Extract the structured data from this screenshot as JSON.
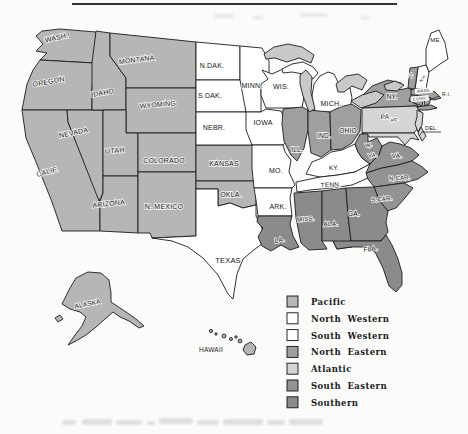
{
  "figure": {
    "type": "printed-us-regions-map",
    "paper_color": "#fbfbf9",
    "border_color": "#1c1c1c",
    "lake_color": "#c9c9c9",
    "label_color": "#161616"
  },
  "regions": [
    {
      "id": "pacific",
      "label": "Pacific",
      "color": "#b6b6b6"
    },
    {
      "id": "north_western",
      "label": "North Western",
      "color": "#ffffff"
    },
    {
      "id": "south_western",
      "label": "South Western",
      "color": "#ffffff"
    },
    {
      "id": "north_eastern",
      "label": "North Eastern",
      "color": "#9f9f9f"
    },
    {
      "id": "atlantic",
      "label": "Atlantic",
      "color": "#d5d5d5"
    },
    {
      "id": "south_eastern",
      "label": "South Eastern",
      "color": "#939393"
    },
    {
      "id": "southern",
      "label": "Southern",
      "color": "#8b8b8b"
    }
  ],
  "map": {
    "states": [
      {
        "id": "wa",
        "label": "WASH.",
        "region": "pacific"
      },
      {
        "id": "or",
        "label": "OREGON",
        "region": "pacific"
      },
      {
        "id": "ca",
        "label": "CALIF.",
        "region": "pacific"
      },
      {
        "id": "nv",
        "label": "NEVADA",
        "region": "pacific"
      },
      {
        "id": "id",
        "label": "IDAHO",
        "region": "pacific"
      },
      {
        "id": "mt",
        "label": "MONTANA",
        "region": "pacific"
      },
      {
        "id": "wy",
        "label": "WYOMING",
        "region": "pacific"
      },
      {
        "id": "ut",
        "label": "UTAH",
        "region": "pacific"
      },
      {
        "id": "co",
        "label": "COLORADO",
        "region": "pacific"
      },
      {
        "id": "az",
        "label": "ARIZONA",
        "region": "pacific"
      },
      {
        "id": "nm",
        "label": "N. MEXICO",
        "region": "pacific"
      },
      {
        "id": "ks",
        "label": "KANSAS",
        "region": "pacific"
      },
      {
        "id": "ok",
        "label": "OKLA.",
        "region": "pacific"
      },
      {
        "id": "nd",
        "label": "N.DAK.",
        "region": "north_western"
      },
      {
        "id": "sd",
        "label": "S.DAK.",
        "region": "north_western"
      },
      {
        "id": "ne",
        "label": "NEBR.",
        "region": "north_western"
      },
      {
        "id": "mn",
        "label": "MINN.",
        "region": "north_western"
      },
      {
        "id": "ia",
        "label": "IOWA",
        "region": "north_western"
      },
      {
        "id": "wi",
        "label": "WIS.",
        "region": "north_western"
      },
      {
        "id": "mi",
        "label": "MICH.",
        "region": "north_western"
      },
      {
        "id": "me",
        "label": "ME.",
        "region": "north_western"
      },
      {
        "id": "nh",
        "label": "N.H.",
        "region": "north_western"
      },
      {
        "id": "mo",
        "label": "MO.",
        "region": "south_western"
      },
      {
        "id": "tx",
        "label": "TEXAS",
        "region": "south_western"
      },
      {
        "id": "ar",
        "label": "ARK.",
        "region": "south_western"
      },
      {
        "id": "ky",
        "label": "KY.",
        "region": "south_western"
      },
      {
        "id": "tn",
        "label": "TENN.",
        "region": "south_western"
      },
      {
        "id": "il",
        "label": "ILL.",
        "region": "north_eastern"
      },
      {
        "id": "in",
        "label": "IND.",
        "region": "north_eastern"
      },
      {
        "id": "oh",
        "label": "OHIO",
        "region": "north_eastern"
      },
      {
        "id": "ny",
        "label": "NY.",
        "region": "north_eastern"
      },
      {
        "id": "vt",
        "label": "VT",
        "region": "north_eastern"
      },
      {
        "id": "ma",
        "label": "MASS.",
        "region": "north_eastern"
      },
      {
        "id": "ct",
        "label": "CONN.",
        "region": "north_eastern"
      },
      {
        "id": "ri",
        "label": "R.I.",
        "region": "north_eastern"
      },
      {
        "id": "pa",
        "label": "PA.",
        "region": "atlantic"
      },
      {
        "id": "nj",
        "label": "",
        "region": "atlantic"
      },
      {
        "id": "de",
        "label": "DEL.",
        "region": "atlantic"
      },
      {
        "id": "md",
        "label": "MD.",
        "region": "atlantic"
      },
      {
        "id": "wv",
        "label": "W.",
        "label2": "VA.",
        "region": "south_eastern"
      },
      {
        "id": "va",
        "label": "VA.",
        "region": "south_eastern"
      },
      {
        "id": "nc",
        "label": "N.CAR.",
        "region": "south_eastern"
      },
      {
        "id": "sc",
        "label": "S.CAR.",
        "region": "south_eastern"
      },
      {
        "id": "la",
        "label": "LA.",
        "region": "southern"
      },
      {
        "id": "ms",
        "label": "MISS.",
        "region": "southern"
      },
      {
        "id": "al",
        "label": "ALA.",
        "region": "southern"
      },
      {
        "id": "ga",
        "label": "GA.",
        "region": "southern"
      },
      {
        "id": "fl",
        "label": "FLA.",
        "region": "southern"
      },
      {
        "id": "ak",
        "label": "ALASKA",
        "region": "pacific"
      },
      {
        "id": "hi",
        "label": "HAWAII",
        "region": "pacific"
      }
    ]
  }
}
